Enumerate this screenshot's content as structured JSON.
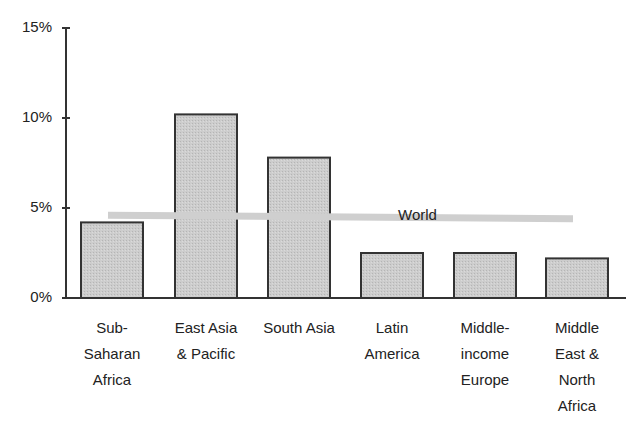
{
  "chart_data": {
    "type": "bar",
    "title": "",
    "xlabel": "",
    "ylabel": "",
    "ylim": [
      0,
      15
    ],
    "yticks": [
      "0%",
      "5%",
      "10%",
      "15%"
    ],
    "ytick_values": [
      0,
      5,
      10,
      15
    ],
    "grid": false,
    "categories": [
      "Sub-\nSaharan\nAfrica",
      "East Asia\n& Pacific",
      "South Asia",
      "Latin\nAmerica",
      "Middle-\nincome\nEurope",
      "Middle\nEast &\nNorth\nAfrica"
    ],
    "series": [
      {
        "name": "Regions",
        "values": [
          4.2,
          10.2,
          7.8,
          2.5,
          2.5,
          2.2
        ]
      }
    ],
    "reference_line": {
      "name": "World",
      "label": "World",
      "value": 4.6,
      "value_end": 4.4
    },
    "colors": {
      "bar_fill": "#c8c8c8",
      "bar_stroke": "#333333",
      "world_line": "#cfcfcf",
      "axis": "#333333"
    }
  }
}
